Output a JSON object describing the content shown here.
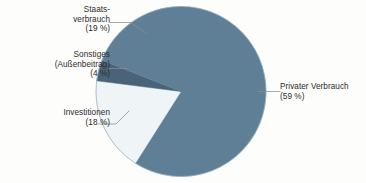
{
  "chart_data": {
    "type": "pie",
    "title": "",
    "subtitle": "",
    "xlabel": "",
    "ylabel": "",
    "legend_position": "callout-labels",
    "grid": false,
    "total_percent": 100,
    "categories": [
      "Privater Verbrauch",
      "Investitionen",
      "Sonstiges (Außenbeitrag)",
      "Staatsverbrauch"
    ],
    "values": [
      59,
      18,
      4,
      19
    ],
    "start_angle_deg": 0,
    "direction": "clockwise",
    "slices": [
      {
        "id": "privater",
        "name": "Privater Verbrauch",
        "value": 59,
        "value_text": "(59 %)",
        "color": "#5E7F96",
        "start_deg": 0,
        "end_deg": 212.4
      },
      {
        "id": "investitionen",
        "name": "Investitionen",
        "value": 18,
        "value_text": "(18 %)",
        "color": "#EFF4F7",
        "start_deg": 212.4,
        "end_deg": 277.2
      },
      {
        "id": "sonstiges",
        "name": "Sonstiges (Außenbeitrag)",
        "value": 4,
        "value_text": "(4 %)",
        "color": "#4A6378",
        "start_deg": 277.2,
        "end_deg": 291.6
      },
      {
        "id": "staatsverbrauch",
        "name": "Staatsverbrauch",
        "value": 19,
        "value_text": "(19 %)",
        "color": "#5E7F96",
        "start_deg": 291.6,
        "end_deg": 360
      }
    ]
  },
  "labels": {
    "staatsverbrauch": {
      "line1": "Staats-",
      "line2": "verbrauch",
      "line3": "(19 %)"
    },
    "sonstiges": {
      "line1": "Sonstiges",
      "line2": "(Außenbeitrag)",
      "line3": "(4 %)"
    },
    "investitionen": {
      "line1": "Investitionen",
      "line2": "(18 %)"
    },
    "privater": {
      "line1": "Privater Verbrauch",
      "line2": "(59 %)"
    }
  },
  "colors": {
    "primary_blue": "#5E7F96",
    "dark_blue": "#4A6378",
    "light_slice": "#EFF4F7",
    "leader_line": "#8d8d8d",
    "background": "#fdfdfc",
    "text": "#2b2b2b"
  },
  "geometry": {
    "center_x": 181,
    "center_y": 91.5,
    "radius": 85
  }
}
